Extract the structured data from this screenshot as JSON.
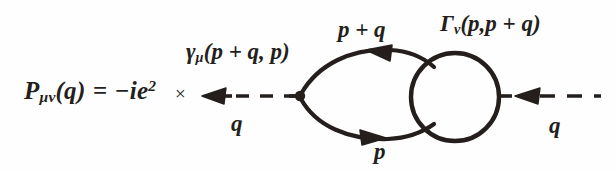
{
  "figure": {
    "type": "feynman-diagram",
    "ink_color": "#241f1c",
    "background_color": "#fefefe"
  },
  "equation": {
    "symbol": "P",
    "subscript": "μν",
    "argument": "(q)",
    "equals": "=",
    "coefficient_sign": "−",
    "coefficient_body": "ie",
    "coefficient_exponent": "2",
    "times": "×"
  },
  "labels": {
    "bare_vertex": {
      "symbol": "γ",
      "subscript": "μ",
      "argument": "(p + q, p)"
    },
    "dressed_vertex": {
      "symbol": "Γ",
      "subscript": "ν",
      "argument": "(p,p + q)"
    },
    "upper_fermion_momentum": "p + q",
    "lower_fermion_momentum": "p",
    "left_photon_momentum": "q",
    "right_photon_momentum": "q"
  },
  "geometry": {
    "left_photon": {
      "from_x": 300,
      "from_y": 96,
      "to_x": 203,
      "to_y": 96,
      "style": "dashed",
      "arrow_direction": "left"
    },
    "right_photon": {
      "from_x": 498,
      "from_y": 96,
      "to_x": 600,
      "to_y": 96,
      "style": "dashed",
      "arrow_direction": "left"
    },
    "vertex_dot": {
      "x": 300,
      "y": 96,
      "r": 5
    },
    "vertex_blob_circle": {
      "cx": 455,
      "cy": 97,
      "r": 44
    },
    "upper_fermion_arc": {
      "arrow_x": 378,
      "arrow_y": 54,
      "direction": "left"
    },
    "lower_fermion_arc": {
      "arrow_x": 372,
      "arrow_y": 138,
      "direction": "right"
    }
  }
}
